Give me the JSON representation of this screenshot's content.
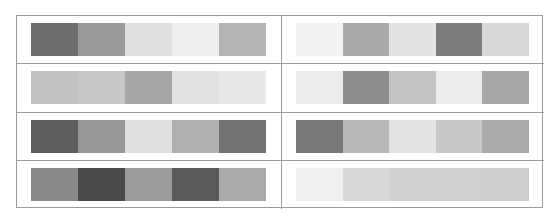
{
  "grid": {
    "columns": 2,
    "rows": 4,
    "border_color": "#9a9a9a",
    "palettes": [
      {
        "id": "palette-1",
        "colors": [
          "#6e6e6e",
          "#9a9a9a",
          "#e0e0e0",
          "#eeeeee",
          "#b4b4b4"
        ]
      },
      {
        "id": "palette-2",
        "colors": [
          "#f2f2f2",
          "#aaaaaa",
          "#e2e2e2",
          "#7c7c7c",
          "#d8d8d8"
        ]
      },
      {
        "id": "palette-3",
        "colors": [
          "#c2c2c2",
          "#c8c8c8",
          "#a6a6a6",
          "#e2e2e2",
          "#e8e8e8"
        ]
      },
      {
        "id": "palette-4",
        "colors": [
          "#ececec",
          "#8e8e8e",
          "#c4c4c4",
          "#ebebeb",
          "#a8a8a8"
        ]
      },
      {
        "id": "palette-5",
        "colors": [
          "#5e5e5e",
          "#979797",
          "#e0e0e0",
          "#b0b0b0",
          "#727272"
        ]
      },
      {
        "id": "palette-6",
        "colors": [
          "#787878",
          "#b8b8b8",
          "#e4e4e4",
          "#c8c8c8",
          "#ababab"
        ]
      },
      {
        "id": "palette-7",
        "colors": [
          "#8a8a8a",
          "#4a4a4a",
          "#9c9c9c",
          "#5a5a5a",
          "#ababab"
        ]
      },
      {
        "id": "palette-8",
        "colors": [
          "#efefef",
          "#d8d8d8",
          "#d0d0d0",
          "#cfcfcf",
          "#cdcdcd"
        ]
      }
    ]
  }
}
